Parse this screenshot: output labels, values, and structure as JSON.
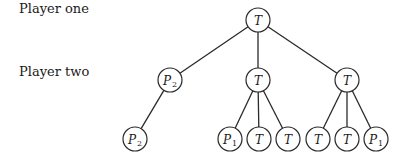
{
  "row_labels": [
    {
      "text": "Player one",
      "x": 19,
      "y": 9
    },
    {
      "text": "Player two",
      "x": 19,
      "y": 72
    }
  ],
  "tree": {
    "node_radius": 12,
    "nodes": [
      {
        "id": "n0",
        "label": "T",
        "sub": "",
        "x": 258,
        "y": 20,
        "level": 1
      },
      {
        "id": "n1",
        "label": "P",
        "sub": "2",
        "x": 170,
        "y": 80,
        "level": 2
      },
      {
        "id": "n2",
        "label": "T",
        "sub": "",
        "x": 258,
        "y": 80,
        "level": 2
      },
      {
        "id": "n3",
        "label": "T",
        "sub": "",
        "x": 347,
        "y": 80,
        "level": 2
      },
      {
        "id": "n4",
        "label": "P",
        "sub": "2",
        "x": 135,
        "y": 139,
        "level": 3
      },
      {
        "id": "n5",
        "label": "P",
        "sub": "1",
        "x": 230,
        "y": 139,
        "level": 3
      },
      {
        "id": "n6",
        "label": "T",
        "sub": "",
        "x": 259,
        "y": 139,
        "level": 3
      },
      {
        "id": "n7",
        "label": "T",
        "sub": "",
        "x": 288,
        "y": 139,
        "level": 3
      },
      {
        "id": "n8",
        "label": "T",
        "sub": "",
        "x": 318,
        "y": 139,
        "level": 3
      },
      {
        "id": "n9",
        "label": "T",
        "sub": "",
        "x": 347,
        "y": 139,
        "level": 3
      },
      {
        "id": "n10",
        "label": "P",
        "sub": "1",
        "x": 376,
        "y": 139,
        "level": 3
      }
    ],
    "edges": [
      [
        "n0",
        "n1"
      ],
      [
        "n0",
        "n2"
      ],
      [
        "n0",
        "n3"
      ],
      [
        "n1",
        "n4"
      ],
      [
        "n2",
        "n5"
      ],
      [
        "n2",
        "n6"
      ],
      [
        "n2",
        "n7"
      ],
      [
        "n3",
        "n8"
      ],
      [
        "n3",
        "n9"
      ],
      [
        "n3",
        "n10"
      ]
    ]
  }
}
